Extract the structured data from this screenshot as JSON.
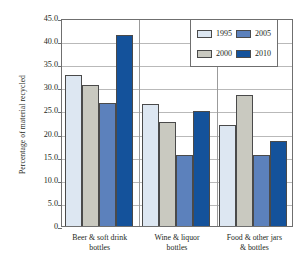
{
  "chart_data": {
    "type": "bar",
    "title": "",
    "xlabel": "",
    "ylabel": "Percentage of material recycled",
    "ylim": [
      0,
      45
    ],
    "ytick_labels": [
      "45.0",
      "40.0",
      "35.0",
      "30.0",
      "25.0",
      "20.0",
      "15.0",
      "10.0",
      "5.0",
      "0"
    ],
    "ytick_values": [
      45,
      40,
      35,
      30,
      25,
      20,
      15,
      10,
      5,
      0
    ],
    "grid": true,
    "legend_position": "top-right",
    "categories": [
      "Beer & soft drink bottles",
      "Wine & liquor bottles",
      "Food & other jars & bottles"
    ],
    "category_lines": [
      [
        "Beer & soft drink",
        "bottles"
      ],
      [
        "Wine & liquor",
        "bottles"
      ],
      [
        "Food & other jars",
        "& bottles"
      ]
    ],
    "series": [
      {
        "name": "1995",
        "color": "#dde7f2",
        "values": [
          32.7,
          26.4,
          21.9
        ]
      },
      {
        "name": "2000",
        "color": "#c9c9c0",
        "values": [
          30.6,
          22.5,
          28.4
        ]
      },
      {
        "name": "2005",
        "color": "#5c81bc",
        "values": [
          26.7,
          15.4,
          15.3
        ]
      },
      {
        "name": "2010",
        "color": "#14529b",
        "values": [
          41.4,
          24.9,
          18.4
        ]
      }
    ]
  },
  "legend": {
    "entries": [
      {
        "label": "1995"
      },
      {
        "label": "2000"
      },
      {
        "label": "2005"
      },
      {
        "label": "2010"
      }
    ]
  }
}
